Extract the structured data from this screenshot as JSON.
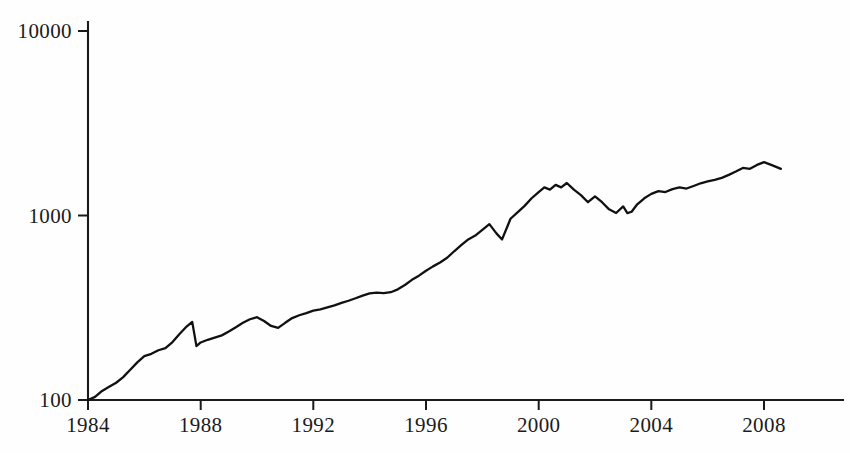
{
  "chart_data": {
    "type": "line",
    "title": "",
    "subtitle": "",
    "xlabel": "",
    "ylabel": "",
    "yscale": "log",
    "xscale": "linear",
    "grid": false,
    "legend": null,
    "xlim": [
      1984,
      2009
    ],
    "ylim": [
      100,
      10000
    ],
    "xticks": [
      1984,
      1988,
      1992,
      1996,
      2000,
      2004,
      2008
    ],
    "xtick_labels": [
      "1984",
      "1988",
      "1992",
      "1996",
      "2000",
      "2004",
      "2008"
    ],
    "yticks": [
      100,
      1000,
      10000
    ],
    "ytick_labels": [
      "100",
      "1000",
      "10000"
    ],
    "line_color": "#111111",
    "background_color": "#fefefe",
    "axis_color": "#1a1a1a",
    "series": [
      {
        "name": "index",
        "x": [
          1984.0,
          1984.25,
          1984.5,
          1984.75,
          1985.0,
          1985.25,
          1985.5,
          1985.75,
          1986.0,
          1986.25,
          1986.5,
          1986.75,
          1987.0,
          1987.25,
          1987.5,
          1987.7,
          1987.85,
          1988.0,
          1988.25,
          1988.5,
          1988.75,
          1989.0,
          1989.25,
          1989.5,
          1989.75,
          1990.0,
          1990.25,
          1990.5,
          1990.75,
          1991.0,
          1991.25,
          1991.5,
          1991.75,
          1992.0,
          1992.25,
          1992.5,
          1992.75,
          1993.0,
          1993.25,
          1993.5,
          1993.75,
          1994.0,
          1994.25,
          1994.5,
          1994.75,
          1995.0,
          1995.25,
          1995.5,
          1995.75,
          1996.0,
          1996.25,
          1996.5,
          1996.75,
          1997.0,
          1997.25,
          1997.5,
          1997.75,
          1998.0,
          1998.25,
          1998.5,
          1998.7,
          1998.9,
          1999.0,
          1999.25,
          1999.5,
          1999.75,
          2000.0,
          2000.2,
          2000.4,
          2000.6,
          2000.8,
          2001.0,
          2001.25,
          2001.5,
          2001.75,
          2002.0,
          2002.25,
          2002.5,
          2002.75,
          2003.0,
          2003.15,
          2003.3,
          2003.5,
          2003.75,
          2004.0,
          2004.25,
          2004.5,
          2004.75,
          2005.0,
          2005.25,
          2005.5,
          2005.75,
          2006.0,
          2006.25,
          2006.5,
          2006.75,
          2007.0,
          2007.25,
          2007.5,
          2007.75,
          2008.0,
          2008.3,
          2008.6
        ],
        "y": [
          100,
          104,
          112,
          118,
          124,
          133,
          146,
          160,
          173,
          178,
          186,
          191,
          206,
          228,
          250,
          265,
          196,
          205,
          212,
          218,
          224,
          235,
          248,
          262,
          274,
          281,
          268,
          252,
          246,
          262,
          278,
          288,
          296,
          305,
          310,
          318,
          326,
          336,
          345,
          356,
          368,
          378,
          382,
          380,
          384,
          398,
          420,
          448,
          472,
          502,
          530,
          556,
          590,
          640,
          690,
          742,
          778,
          836,
          898,
          800,
          742,
          880,
          960,
          1040,
          1128,
          1240,
          1340,
          1420,
          1380,
          1465,
          1420,
          1500,
          1380,
          1290,
          1180,
          1270,
          1180,
          1080,
          1032,
          1120,
          1030,
          1048,
          1150,
          1240,
          1310,
          1356,
          1340,
          1390,
          1420,
          1400,
          1445,
          1495,
          1530,
          1560,
          1600,
          1660,
          1730,
          1810,
          1790,
          1880,
          1945,
          1870,
          1790
        ]
      }
    ],
    "annotations": [
      {
        "label": "1987 crash peak-then-drop",
        "x": 1987.7,
        "y": 265
      },
      {
        "label": "1990 dip",
        "x": 1990.75,
        "y": 246
      },
      {
        "label": "2000 peak",
        "x": 2001.0,
        "y": 1500
      },
      {
        "label": "2003 trough",
        "x": 2002.75,
        "y": 1032
      },
      {
        "label": "2007 peak",
        "x": 2008.0,
        "y": 1945
      }
    ]
  },
  "axes": {
    "y_tick_labels": [
      "10000",
      "1000",
      "100"
    ],
    "x_tick_labels": [
      "1984",
      "1988",
      "1992",
      "1996",
      "2000",
      "2004",
      "2008"
    ]
  }
}
